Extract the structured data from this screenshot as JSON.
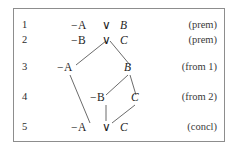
{
  "figure": {
    "type": "resolution-proof-tree",
    "border_color": "#8d8d8d",
    "background": "#ffffff",
    "text_color": "#1e1e1e",
    "negation_symbol": "−",
    "disjunction_symbol": "∨"
  },
  "rows": [
    {
      "number": "1",
      "formula": "−A ∨ B",
      "justification": "(prem)",
      "tokens": [
        {
          "text": "−A",
          "kind": "literal"
        },
        {
          "text": "∨",
          "kind": "connective"
        },
        {
          "text": "B",
          "kind": "literal"
        }
      ]
    },
    {
      "number": "2",
      "formula": "−B ∨ C",
      "justification": "(prem)",
      "tokens": [
        {
          "text": "−B",
          "kind": "literal"
        },
        {
          "text": "∨",
          "kind": "connective"
        },
        {
          "text": "C",
          "kind": "literal"
        }
      ]
    },
    {
      "number": "3",
      "formula": "−A      B",
      "justification": "(from 1)",
      "tokens": [
        {
          "text": "−A",
          "kind": "literal"
        },
        {
          "text": "B",
          "kind": "literal"
        }
      ]
    },
    {
      "number": "4",
      "formula": "−B   C",
      "justification": "(from 2)",
      "tokens": [
        {
          "text": "−B",
          "kind": "literal"
        },
        {
          "text": "C",
          "kind": "literal"
        }
      ]
    },
    {
      "number": "5",
      "formula": "−A ∨ C",
      "justification": "(concl)",
      "tokens": [
        {
          "text": "−A",
          "kind": "literal"
        },
        {
          "text": "∨",
          "kind": "connective"
        },
        {
          "text": "C",
          "kind": "literal"
        }
      ]
    }
  ],
  "labels": {
    "r1_num": "1",
    "r1_negA": "−A",
    "r1_or": "∨",
    "r1_B": "B",
    "r1_just": "(prem)",
    "r2_num": "2",
    "r2_negB": "−B",
    "r2_or": "∨",
    "r2_C": "C",
    "r2_just": "(prem)",
    "r3_num": "3",
    "r3_negA": "−A",
    "r3_B": "B",
    "r3_just": "(from 1)",
    "r4_num": "4",
    "r4_negB": "−B",
    "r4_C": "C",
    "r4_just": "(from 2)",
    "r5_num": "5",
    "r5_negA": "−A",
    "r5_or": "∨",
    "r5_C": "C",
    "r5_just": "(concl)"
  }
}
